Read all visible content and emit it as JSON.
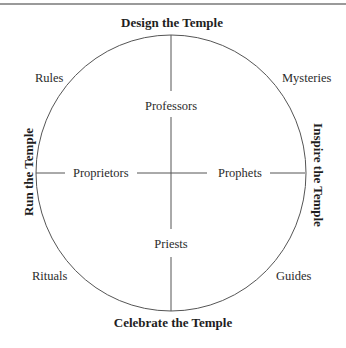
{
  "diagram": {
    "titles": {
      "top": "Design the Temple",
      "bottom": "Celebrate the Temple",
      "left": "Run the Temple",
      "right": "Inspire the Temple"
    },
    "axis_labels": {
      "top": "Professors",
      "bottom": "Priests",
      "left": "Proprietors",
      "right": "Prophets"
    },
    "quadrant_labels": {
      "top_left": "Rules",
      "top_right": "Mysteries",
      "bottom_left": "Rituals",
      "bottom_right": "Guides"
    },
    "colors": {
      "line": "#555555",
      "text": "#2b2b2b",
      "rule": "#9a9a9a"
    }
  }
}
